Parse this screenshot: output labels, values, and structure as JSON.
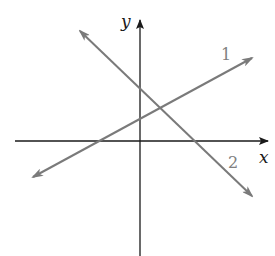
{
  "diagram": {
    "type": "coordinate-plane",
    "axes": {
      "x_label": "x",
      "y_label": "y"
    },
    "lines": [
      {
        "label": "1",
        "description": "line with positive slope, y-intercept above origin"
      },
      {
        "label": "2",
        "description": "line with negative slope, y-intercept above line 1's intercept"
      }
    ],
    "colors": {
      "axes": "#1a1a1a",
      "lines": "#7a7a7a",
      "labels": "#808080"
    }
  }
}
